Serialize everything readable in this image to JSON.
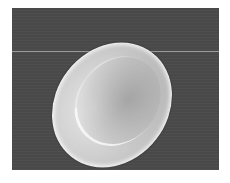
{
  "image": {
    "subject": "red blood cell (scanning electron micrograph)",
    "background_color": "#4a4a4a",
    "cell_color": "#d4d4d4",
    "frame_color": "#ffffff"
  }
}
